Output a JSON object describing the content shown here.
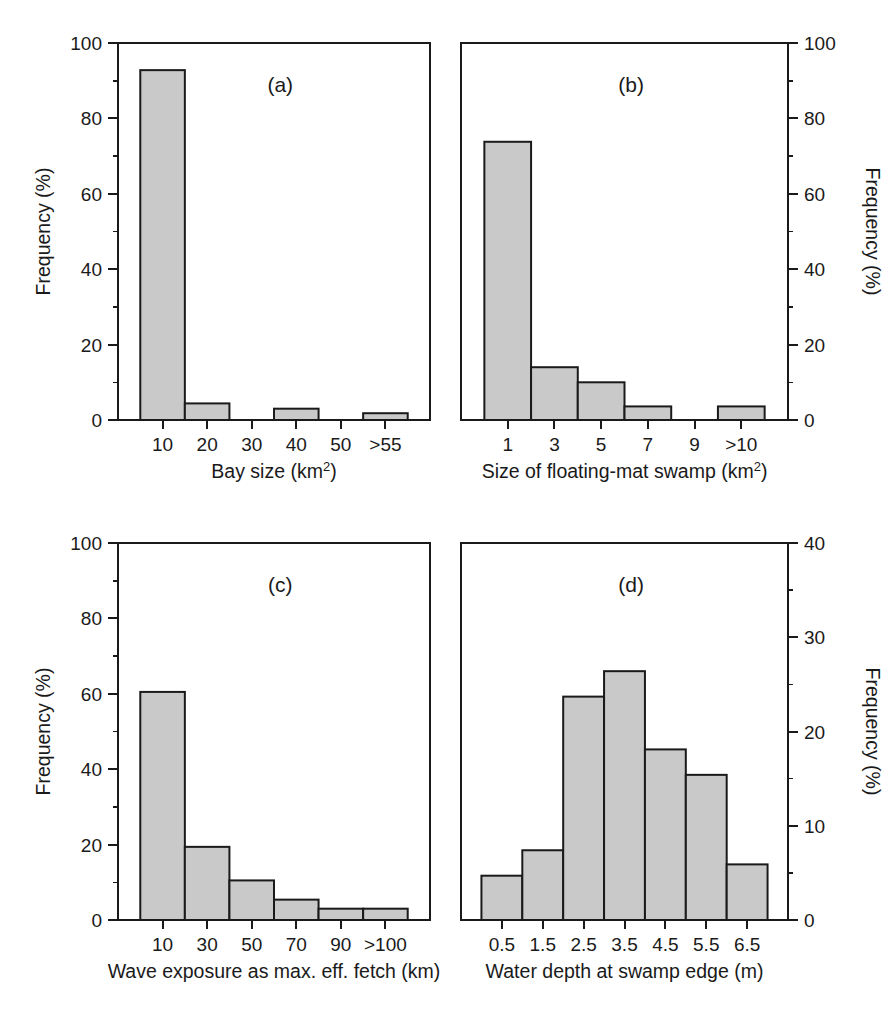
{
  "figure": {
    "background": "#ffffff",
    "bar_fill": "#c9c9c9",
    "bar_stroke": "#1a1a1a",
    "axis_color": "#1a1a1a",
    "y_axis_title": "Frequency (%)"
  },
  "panels": {
    "a": {
      "tag": "(a)",
      "xlabel_main": "Bay size (km",
      "xlabel_sup": "2",
      "xlabel_tail": ")",
      "ylabel": "Frequency (%)",
      "y_axis_side": "left",
      "ytick_labels": [
        "0",
        "20",
        "40",
        "60",
        "80",
        "100"
      ],
      "xtick_labels": [
        "10",
        "20",
        "30",
        "40",
        "50",
        ">55"
      ]
    },
    "b": {
      "tag": "(b)",
      "xlabel_main": "Size of floating-mat swamp (km",
      "xlabel_sup": "2",
      "xlabel_tail": ")",
      "ylabel": "Frequency (%)",
      "y_axis_side": "right",
      "ytick_labels": [
        "0",
        "20",
        "40",
        "60",
        "80",
        "100"
      ],
      "xtick_labels": [
        "1",
        "3",
        "5",
        "7",
        "9",
        ">10"
      ]
    },
    "c": {
      "tag": "(c)",
      "xlabel_main": "Wave exposure as max. eff. fetch (km)",
      "xlabel_sup": "",
      "xlabel_tail": "",
      "ylabel": "Frequency (%)",
      "y_axis_side": "left",
      "ytick_labels": [
        "0",
        "20",
        "40",
        "60",
        "80",
        "100"
      ],
      "xtick_labels": [
        "10",
        "30",
        "50",
        "70",
        "90",
        ">100"
      ]
    },
    "d": {
      "tag": "(d)",
      "xlabel_main": "Water depth at swamp edge (m)",
      "xlabel_sup": "",
      "xlabel_tail": "",
      "ylabel": "Frequency (%)",
      "y_axis_side": "right",
      "ytick_labels": [
        "0",
        "10",
        "20",
        "30",
        "40"
      ],
      "xtick_labels": [
        "0.5",
        "1.5",
        "2.5",
        "3.5",
        "4.5",
        "5.5",
        "6.5"
      ]
    }
  },
  "chart_data": [
    {
      "id": "a",
      "type": "bar",
      "title": "(a)",
      "xlabel": "Bay size (km2)",
      "ylabel": "Frequency (%)",
      "categories": [
        "10",
        "20",
        "30",
        "40",
        "50",
        ">55"
      ],
      "values": [
        92.8,
        4.4,
        0,
        3.0,
        0,
        1.8
      ],
      "ylim": [
        0,
        100
      ],
      "yticks": [
        0,
        20,
        40,
        60,
        80,
        100
      ],
      "grid": false,
      "legend": "none",
      "y_axis_position": "left"
    },
    {
      "id": "b",
      "type": "bar",
      "title": "(b)",
      "xlabel": "Size of floating-mat swamp (km2)",
      "ylabel": "Frequency (%)",
      "categories": [
        "1",
        "3",
        "5",
        "7",
        "9",
        ">10"
      ],
      "values": [
        73.8,
        14.0,
        10.0,
        3.6,
        0,
        3.6
      ],
      "ylim": [
        0,
        100
      ],
      "yticks": [
        0,
        20,
        40,
        60,
        80,
        100
      ],
      "grid": false,
      "legend": "none",
      "y_axis_position": "right"
    },
    {
      "id": "c",
      "type": "bar",
      "title": "(c)",
      "xlabel": "Wave exposure as max. eff. fetch (km)",
      "ylabel": "Frequency (%)",
      "categories": [
        "10",
        "30",
        "50",
        "70",
        "90",
        ">100"
      ],
      "values": [
        60.5,
        19.4,
        10.5,
        5.4,
        3.0,
        3.0
      ],
      "ylim": [
        0,
        100
      ],
      "yticks": [
        0,
        20,
        40,
        60,
        80,
        100
      ],
      "grid": false,
      "legend": "none",
      "y_axis_position": "left"
    },
    {
      "id": "d",
      "type": "bar",
      "title": "(d)",
      "xlabel": "Water depth at swamp edge (m)",
      "ylabel": "Frequency (%)",
      "categories": [
        "0.5",
        "1.5",
        "2.5",
        "3.5",
        "4.5",
        "5.5",
        "6.5"
      ],
      "values": [
        4.7,
        7.4,
        23.7,
        26.4,
        18.1,
        15.4,
        5.9
      ],
      "ylim": [
        0,
        40
      ],
      "yticks": [
        0,
        10,
        20,
        30,
        40
      ],
      "grid": false,
      "legend": "none",
      "y_axis_position": "right"
    }
  ]
}
